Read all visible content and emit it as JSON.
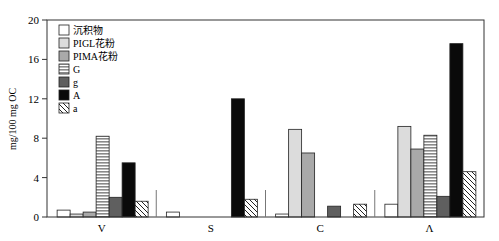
{
  "chart_data": {
    "type": "bar",
    "title": "",
    "xlabel": "",
    "ylabel": "mg/100 mg OC",
    "ylim": [
      0,
      20
    ],
    "yticks": [
      0,
      4,
      8,
      12,
      16,
      20
    ],
    "grid": false,
    "legend_position": "upper-left-inside",
    "categories": [
      "V",
      "S",
      "C",
      "Λ"
    ],
    "series": [
      {
        "name": "沉积物",
        "pattern": "white",
        "values": [
          0.7,
          0.5,
          0.3,
          1.3
        ]
      },
      {
        "name": "PIGL花粉",
        "pattern": "light-gray",
        "values": [
          0.3,
          0,
          8.9,
          9.2
        ]
      },
      {
        "name": "PIMA花粉",
        "pattern": "mid-gray",
        "values": [
          0.5,
          0,
          6.5,
          6.9
        ]
      },
      {
        "name": "G",
        "pattern": "horizontal-stripes",
        "values": [
          8.2,
          0,
          0,
          8.3
        ]
      },
      {
        "name": "g",
        "pattern": "dark-gray",
        "values": [
          2.0,
          0,
          1.1,
          2.1
        ]
      },
      {
        "name": "A",
        "pattern": "black",
        "values": [
          5.5,
          12.0,
          0,
          17.6
        ]
      },
      {
        "name": "a",
        "pattern": "diagonal-hatch",
        "values": [
          1.6,
          1.8,
          1.3,
          4.6
        ]
      }
    ]
  },
  "colors": {
    "white": "#ffffff",
    "light-gray": "#dcdcdc",
    "mid-gray": "#a9a9a9",
    "horizontal-stripes": "#9a9a9a",
    "dark-gray": "#5f5f5f",
    "black": "#0a0a0a",
    "axis": "#333333"
  }
}
